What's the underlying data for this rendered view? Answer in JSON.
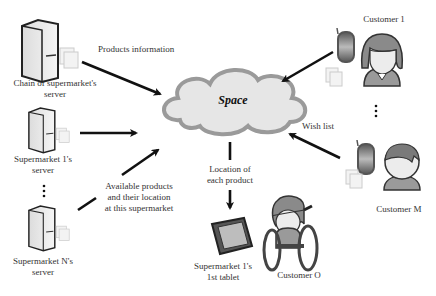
{
  "cloud": {
    "label": "Space"
  },
  "servers": [
    {
      "id": "chain",
      "label_lines": [
        "Chain of supermarket's",
        "server"
      ]
    },
    {
      "id": "sm1",
      "label_lines": [
        "Supermarket 1's",
        "server"
      ]
    },
    {
      "id": "smN",
      "label_lines": [
        "Supermarket N's",
        "server"
      ]
    }
  ],
  "customers": [
    {
      "id": "c1",
      "label": "Customer 1"
    },
    {
      "id": "cM",
      "label": "Customer M"
    },
    {
      "id": "cO",
      "label": "Customer O"
    }
  ],
  "tablet": {
    "label_lines": [
      "Supermarket 1's",
      "1st tablet"
    ]
  },
  "arrows": {
    "products_information": "Products information",
    "available_products_lines": [
      "Available products",
      "and their location",
      "at this supermarket"
    ],
    "location_lines": [
      "Location of",
      "each product"
    ],
    "wish_list": "Wish list"
  },
  "ellipsis": "⋮",
  "colors": {
    "cloud_fill": "#e8e8e8",
    "cloud_stroke": "#9a9a9a",
    "arrow": "#111111",
    "person_fill": "#9a9a9a",
    "face": "#ececec"
  }
}
